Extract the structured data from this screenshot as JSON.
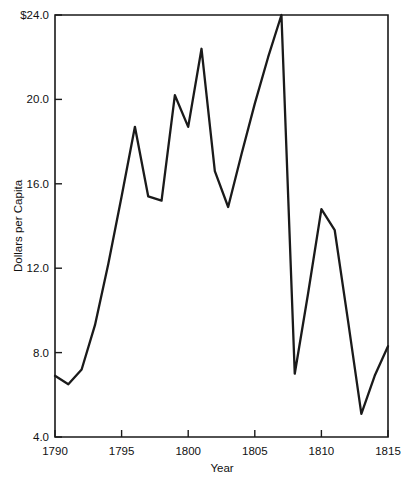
{
  "chart_data": {
    "type": "line",
    "title": "",
    "xlabel": "Year",
    "ylabel": "Dollars per Capita",
    "xlim": [
      1790,
      1815
    ],
    "ylim": [
      4.0,
      24.0
    ],
    "grid": false,
    "legend": "none",
    "x_ticks": [
      1790,
      1795,
      1800,
      1805,
      1810,
      1815
    ],
    "x_tick_labels": [
      "1790",
      "1795",
      "1800",
      "1805",
      "1810",
      "1815"
    ],
    "y_ticks": [
      4.0,
      8.0,
      12.0,
      16.0,
      20.0,
      24.0
    ],
    "y_tick_labels": [
      "4.0",
      "8.0",
      "12.0",
      "16.0",
      "20.0",
      "$24.0"
    ],
    "x": [
      1790,
      1791,
      1792,
      1793,
      1794,
      1795,
      1796,
      1797,
      1798,
      1799,
      1800,
      1801,
      1802,
      1803,
      1804,
      1805,
      1806,
      1807,
      1808,
      1809,
      1810,
      1811,
      1812,
      1813,
      1814,
      1815
    ],
    "values": [
      6.9,
      6.5,
      7.2,
      9.3,
      12.2,
      15.4,
      18.7,
      15.4,
      15.2,
      20.2,
      18.7,
      22.4,
      16.6,
      14.9,
      17.4,
      19.8,
      22.0,
      24.0,
      7.0,
      10.8,
      14.8,
      13.8,
      9.5,
      5.1,
      6.9,
      8.3
    ],
    "series_name": "Dollars per Capita",
    "line_color": "#1a1a1a"
  },
  "axis": {
    "y_label": "Dollars per Capita",
    "x_label": "Year"
  }
}
